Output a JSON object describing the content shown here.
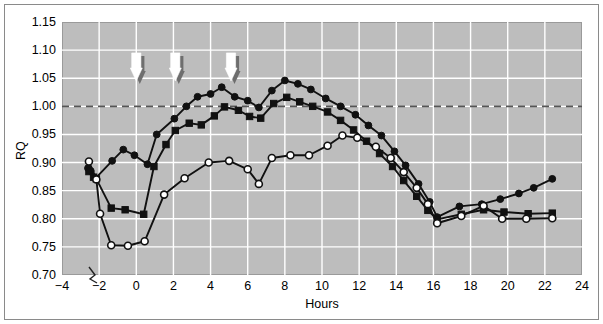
{
  "chart_data": {
    "type": "line",
    "title": "",
    "xlabel": "Hours",
    "ylabel": "RQ",
    "xlim": [
      -4,
      24
    ],
    "ylim": [
      0.7,
      1.15
    ],
    "xticks": [
      -4,
      -2,
      0,
      2,
      4,
      6,
      8,
      10,
      12,
      14,
      16,
      18,
      20,
      22,
      24
    ],
    "xtick_labels": [
      "−4",
      "−2",
      "0",
      "2",
      "4",
      "6",
      "8",
      "10",
      "12",
      "14",
      "16",
      "18",
      "20",
      "22",
      "24"
    ],
    "yticks": [
      0.7,
      0.75,
      0.8,
      0.85,
      0.9,
      0.95,
      1.0,
      1.05,
      1.1,
      1.15
    ],
    "ytick_labels": [
      "0.70",
      "0.75",
      "0.80",
      "0.85",
      "0.90",
      "0.95",
      "1.00",
      "1.05",
      "1.10",
      "1.15"
    ],
    "grid": true,
    "grid_color": "#ffffff",
    "plot_bgcolor": "#bdbdbd",
    "reference_line": {
      "y": 1.0,
      "style": "dashed",
      "color": "#555555"
    },
    "axis_break": {
      "x": -2.2,
      "note": "zigzag break on x-axis"
    },
    "legend_position": "none",
    "series": [
      {
        "name": "High carbohydrate",
        "marker": "filled-circle",
        "color": "#111111",
        "points": [
          [
            -2.6,
            0.89
          ],
          [
            -2.45,
            0.885
          ],
          [
            -2.2,
            0.872
          ],
          [
            -1.3,
            0.903
          ],
          [
            -0.7,
            0.923
          ],
          [
            -0.1,
            0.913
          ],
          [
            0.6,
            0.897
          ],
          [
            1.1,
            0.95
          ],
          [
            2.05,
            0.978
          ],
          [
            2.7,
            1.0
          ],
          [
            3.3,
            1.017
          ],
          [
            4.0,
            1.022
          ],
          [
            4.6,
            1.034
          ],
          [
            5.3,
            1.017
          ],
          [
            6.0,
            1.01
          ],
          [
            6.6,
            0.998
          ],
          [
            7.3,
            1.028
          ],
          [
            8.0,
            1.046
          ],
          [
            8.7,
            1.04
          ],
          [
            9.4,
            1.03
          ],
          [
            10.2,
            1.014
          ],
          [
            11.0,
            1.0
          ],
          [
            11.8,
            0.985
          ],
          [
            12.5,
            0.966
          ],
          [
            13.2,
            0.948
          ],
          [
            13.9,
            0.92
          ],
          [
            14.5,
            0.895
          ],
          [
            15.2,
            0.862
          ],
          [
            15.8,
            0.83
          ],
          [
            16.2,
            0.803
          ],
          [
            17.4,
            0.822
          ],
          [
            18.6,
            0.826
          ],
          [
            19.6,
            0.835
          ],
          [
            20.6,
            0.845
          ],
          [
            21.4,
            0.855
          ],
          [
            22.4,
            0.871
          ]
        ]
      },
      {
        "name": "Medium carbohydrate",
        "marker": "filled-square",
        "color": "#111111",
        "points": [
          [
            -2.55,
            0.884
          ],
          [
            -2.3,
            0.874
          ],
          [
            -2.15,
            0.871
          ],
          [
            -1.35,
            0.819
          ],
          [
            -0.6,
            0.816
          ],
          [
            0.4,
            0.808
          ],
          [
            0.95,
            0.893
          ],
          [
            1.6,
            0.932
          ],
          [
            2.1,
            0.957
          ],
          [
            2.85,
            0.97
          ],
          [
            3.5,
            0.967
          ],
          [
            4.2,
            0.983
          ],
          [
            4.75,
            0.999
          ],
          [
            5.5,
            0.993
          ],
          [
            6.1,
            0.982
          ],
          [
            6.7,
            0.979
          ],
          [
            7.4,
            1.005
          ],
          [
            8.1,
            1.016
          ],
          [
            8.8,
            1.008
          ],
          [
            9.5,
            1.0
          ],
          [
            10.3,
            0.99
          ],
          [
            11.0,
            0.975
          ],
          [
            11.7,
            0.958
          ],
          [
            12.4,
            0.938
          ],
          [
            13.1,
            0.916
          ],
          [
            13.8,
            0.893
          ],
          [
            14.4,
            0.868
          ],
          [
            15.1,
            0.84
          ],
          [
            15.7,
            0.815
          ],
          [
            16.2,
            0.799
          ],
          [
            17.5,
            0.808
          ],
          [
            18.7,
            0.816
          ],
          [
            19.8,
            0.812
          ],
          [
            21.1,
            0.809
          ],
          [
            22.4,
            0.81
          ]
        ]
      },
      {
        "name": "Low carbohydrate",
        "marker": "open-circle",
        "color": "#111111",
        "points": [
          [
            -2.55,
            0.902
          ],
          [
            -2.15,
            0.87
          ],
          [
            -1.95,
            0.809
          ],
          [
            -1.35,
            0.753
          ],
          [
            -0.45,
            0.752
          ],
          [
            0.45,
            0.76
          ],
          [
            1.5,
            0.843
          ],
          [
            2.6,
            0.872
          ],
          [
            3.9,
            0.9
          ],
          [
            5.0,
            0.903
          ],
          [
            6.0,
            0.888
          ],
          [
            6.6,
            0.862
          ],
          [
            7.3,
            0.908
          ],
          [
            8.3,
            0.913
          ],
          [
            9.3,
            0.913
          ],
          [
            10.3,
            0.93
          ],
          [
            11.1,
            0.948
          ],
          [
            11.9,
            0.944
          ],
          [
            12.9,
            0.928
          ],
          [
            13.7,
            0.908
          ],
          [
            14.4,
            0.883
          ],
          [
            15.1,
            0.855
          ],
          [
            15.7,
            0.826
          ],
          [
            16.2,
            0.792
          ],
          [
            17.5,
            0.805
          ],
          [
            18.7,
            0.823
          ],
          [
            19.7,
            0.8
          ],
          [
            21.0,
            0.8
          ],
          [
            22.4,
            0.801
          ]
        ]
      }
    ],
    "annotations": {
      "title": "Intake of carbohydrates",
      "title_x": 5.4,
      "arrows": [
        {
          "label": "250 g",
          "x": 0.0
        },
        {
          "label": "125 g",
          "x": 2.1
        },
        {
          "label": "125 g",
          "x": 5.1
        }
      ]
    }
  }
}
